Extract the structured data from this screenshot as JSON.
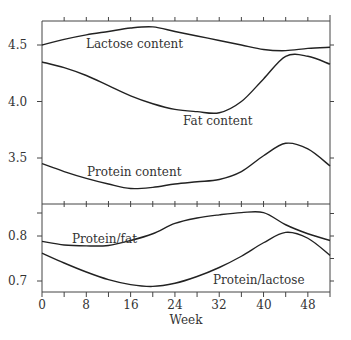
{
  "chart_data": [
    {
      "type": "line",
      "panel": "upper",
      "title": "",
      "xlabel": "Week",
      "ylabel": "",
      "xlim": [
        0,
        52
      ],
      "ylim": [
        3.2,
        4.71
      ],
      "yticks": [
        "3.5",
        "4.0",
        "4.5"
      ],
      "x": [
        0,
        4,
        8,
        12,
        16,
        20,
        24,
        28,
        32,
        36,
        40,
        44,
        48,
        52
      ],
      "series": [
        {
          "name": "Lactose content",
          "values": [
            4.5,
            4.55,
            4.59,
            4.62,
            4.65,
            4.66,
            4.62,
            4.58,
            4.54,
            4.5,
            4.46,
            4.45,
            4.47,
            4.48
          ]
        },
        {
          "name": "Fat content",
          "values": [
            4.35,
            4.3,
            4.23,
            4.14,
            4.05,
            3.98,
            3.93,
            3.91,
            3.9,
            4.0,
            4.2,
            4.4,
            4.4,
            4.33
          ]
        },
        {
          "name": "Protein content",
          "values": [
            3.45,
            3.38,
            3.32,
            3.27,
            3.23,
            3.24,
            3.27,
            3.29,
            3.31,
            3.38,
            3.52,
            3.63,
            3.58,
            3.43
          ]
        }
      ],
      "annotations": [
        "Lactose content",
        "Fat content",
        "Protein content"
      ],
      "grid": false
    },
    {
      "type": "line",
      "panel": "lower",
      "title": "",
      "xlabel": "Week",
      "ylabel": "",
      "xlim": [
        0,
        52
      ],
      "ylim": [
        0.675,
        0.87
      ],
      "yticks": [
        "0.7",
        "0.8"
      ],
      "xticks": [
        "0",
        "8",
        "16",
        "24",
        "32",
        "40",
        "48"
      ],
      "x": [
        0,
        4,
        8,
        12,
        16,
        20,
        24,
        28,
        32,
        36,
        40,
        44,
        48,
        52
      ],
      "series": [
        {
          "name": "Protein/fat",
          "values": [
            0.788,
            0.78,
            0.778,
            0.779,
            0.79,
            0.805,
            0.828,
            0.84,
            0.847,
            0.852,
            0.852,
            0.825,
            0.805,
            0.79
          ]
        },
        {
          "name": "Protein/lactose",
          "values": [
            0.762,
            0.74,
            0.72,
            0.703,
            0.692,
            0.688,
            0.695,
            0.71,
            0.73,
            0.755,
            0.785,
            0.808,
            0.795,
            0.757
          ]
        }
      ],
      "annotations": [
        "Protein/fat",
        "Protein/lactose"
      ],
      "grid": false
    }
  ],
  "labels": {
    "lactose": "Lactose content",
    "fat": "Fat content",
    "protein": "Protein content",
    "protein_fat": "Protein/fat",
    "protein_lactose": "Protein/lactose",
    "xlabel": "Week"
  },
  "upper_yticks": [
    "4.5",
    "4.0",
    "3.5"
  ],
  "lower_yticks": [
    "0.8",
    "0.7"
  ],
  "xticks": [
    "0",
    "8",
    "16",
    "24",
    "32",
    "40",
    "48"
  ]
}
